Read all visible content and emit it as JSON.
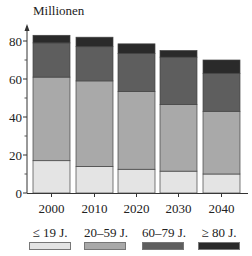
{
  "chart_data": {
    "type": "bar",
    "stacked": true,
    "title": "",
    "ylabel": "Millionen",
    "xlabel": "",
    "ylim": [
      0,
      85
    ],
    "yticks_major": [
      0,
      20,
      40,
      60,
      80
    ],
    "yticks_minor": [
      10,
      30,
      50,
      70
    ],
    "grid": false,
    "legend_position": "bottom",
    "categories": [
      "2000",
      "2010",
      "2020",
      "2030",
      "2040"
    ],
    "series": [
      {
        "name": "≤ 19 J.",
        "color": "#e4e4e4",
        "values": [
          17,
          14,
          12.5,
          11.5,
          10
        ]
      },
      {
        "name": "20–59 J.",
        "color": "#a9a9a9",
        "values": [
          44,
          45,
          41,
          35,
          33
        ]
      },
      {
        "name": "60–79 J.",
        "color": "#5e5e5e",
        "values": [
          18,
          18,
          20,
          25,
          20
        ]
      },
      {
        "name": "≥ 80 J.",
        "color": "#2a2a2a",
        "values": [
          4,
          5,
          5,
          3.5,
          7
        ]
      }
    ]
  }
}
